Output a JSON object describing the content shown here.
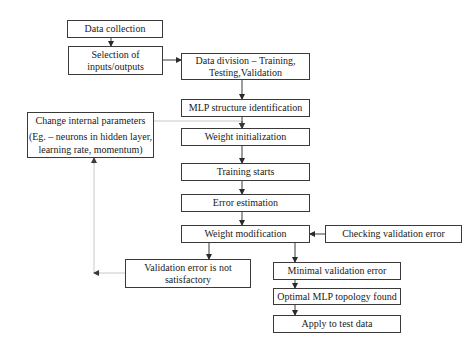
{
  "diagram": {
    "nodes": {
      "data_collection": {
        "label": "Data collection"
      },
      "selection": {
        "line1": "Selection of",
        "line2": "inputs/outputs"
      },
      "data_division": {
        "line1": "Data division – Training,",
        "line2": "Testing,Validation"
      },
      "mlp_structure": {
        "label": "MLP structure identification"
      },
      "change_params": {
        "line1": "Change internal parameters",
        "line2": "(Eg. – neurons in hidden layer,",
        "line3": "learning rate, momentum)"
      },
      "weight_init": {
        "label": "Weight initialization"
      },
      "training_starts": {
        "label": "Training starts"
      },
      "error_estimation": {
        "label": "Error estimation"
      },
      "weight_modification": {
        "label": "Weight modification"
      },
      "checking_validation": {
        "label": "Checking validation error"
      },
      "validation_not_ok": {
        "line1": "Validation error is not",
        "line2": "satisfactory"
      },
      "minimal_validation": {
        "label": "Minimal validation error"
      },
      "optimal_topology": {
        "label": "Optimal MLP topology found"
      },
      "apply_test": {
        "label": "Apply to test data"
      }
    },
    "edges": [
      {
        "from": "Data collection",
        "to": "Selection of inputs/outputs"
      },
      {
        "from": "Selection of inputs/outputs",
        "to": "Data division"
      },
      {
        "from": "Data division",
        "to": "MLP structure identification"
      },
      {
        "from": "MLP structure identification",
        "to": "Weight initialization"
      },
      {
        "from": "Change internal parameters",
        "to": "Weight initialization",
        "style": "gray"
      },
      {
        "from": "Weight initialization",
        "to": "Training starts"
      },
      {
        "from": "Training starts",
        "to": "Error estimation"
      },
      {
        "from": "Error estimation",
        "to": "Weight modification"
      },
      {
        "from": "Checking validation error",
        "to": "Weight modification"
      },
      {
        "from": "Weight modification",
        "to": "Validation error is not satisfactory"
      },
      {
        "from": "Weight modification",
        "to": "Minimal validation error"
      },
      {
        "from": "Validation error is not satisfactory",
        "to": "Change internal parameters",
        "style": "gray"
      },
      {
        "from": "Minimal validation error",
        "to": "Optimal MLP topology found"
      },
      {
        "from": "Optimal MLP topology found",
        "to": "Apply to test data"
      }
    ],
    "colors": {
      "line": "#3a3a3a",
      "feedback_line": "#c8c8c8",
      "background": "#ffffff"
    }
  }
}
